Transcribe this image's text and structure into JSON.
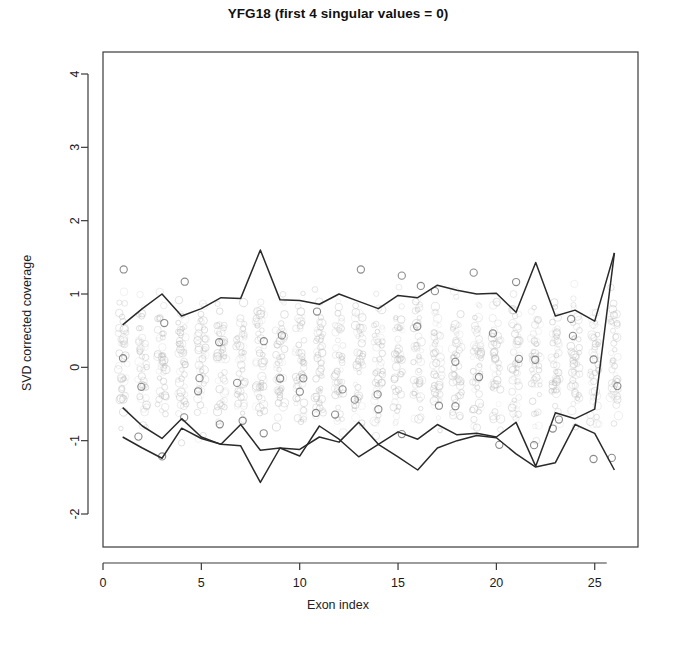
{
  "chart_data": {
    "type": "line",
    "title": "YFG18 (first 4 singular values = 0)",
    "xlabel": "Exon index",
    "ylabel": "SVD corrected coverage",
    "xlim": [
      0,
      27.2
    ],
    "ylim": [
      -2.45,
      4.3
    ],
    "xticks": [
      0,
      5,
      10,
      15,
      20,
      25
    ],
    "yticks": [
      -2,
      -1,
      0,
      1,
      2,
      3,
      4
    ],
    "grid": false,
    "legend": "none",
    "x": [
      1,
      2,
      3,
      4,
      5,
      6,
      7,
      8,
      9,
      10,
      11,
      12,
      13,
      14,
      15,
      16,
      17,
      18,
      19,
      20,
      21,
      22,
      23,
      24,
      25,
      26
    ],
    "series": [
      {
        "name": "upper envelope",
        "color": "#2a2a2a",
        "values": [
          0.58,
          0.8,
          1.0,
          0.7,
          0.8,
          0.95,
          0.94,
          1.6,
          0.92,
          0.91,
          0.86,
          1.0,
          0.9,
          0.8,
          0.98,
          0.95,
          1.12,
          1.05,
          1.0,
          1.01,
          0.75,
          1.43,
          0.7,
          0.78,
          0.63,
          1.56
        ]
      },
      {
        "name": "lower line A",
        "color": "#2a2a2a",
        "values": [
          -0.55,
          -0.8,
          -0.97,
          -0.7,
          -0.95,
          -1.05,
          -0.78,
          -1.13,
          -1.1,
          -1.12,
          -0.95,
          -1.02,
          -0.75,
          -1.05,
          -0.88,
          -0.98,
          -0.78,
          -0.92,
          -0.9,
          -0.95,
          -0.75,
          -1.35,
          -0.62,
          -0.7,
          -0.57,
          1.56
        ]
      },
      {
        "name": "lower line B",
        "color": "#2a2a2a",
        "values": [
          -0.95,
          -1.1,
          -1.24,
          -0.83,
          -0.97,
          -1.05,
          -1.07,
          -1.57,
          -1.1,
          -1.21,
          -0.8,
          -0.98,
          -1.22,
          -1.05,
          -1.22,
          -1.4,
          -1.1,
          -1.0,
          -0.93,
          -0.96,
          -1.18,
          -1.36,
          -1.3,
          -0.78,
          -0.9,
          -1.4
        ]
      }
    ],
    "scatter": {
      "name": "per-sample SVD corrected coverage",
      "marker": "open-circle",
      "color": "#b9b9b9",
      "points_per_index": 44,
      "value_range": [
        -1.25,
        1.35
      ],
      "description": "faint gray open circles stacked in a vertical column at each exon index"
    }
  }
}
